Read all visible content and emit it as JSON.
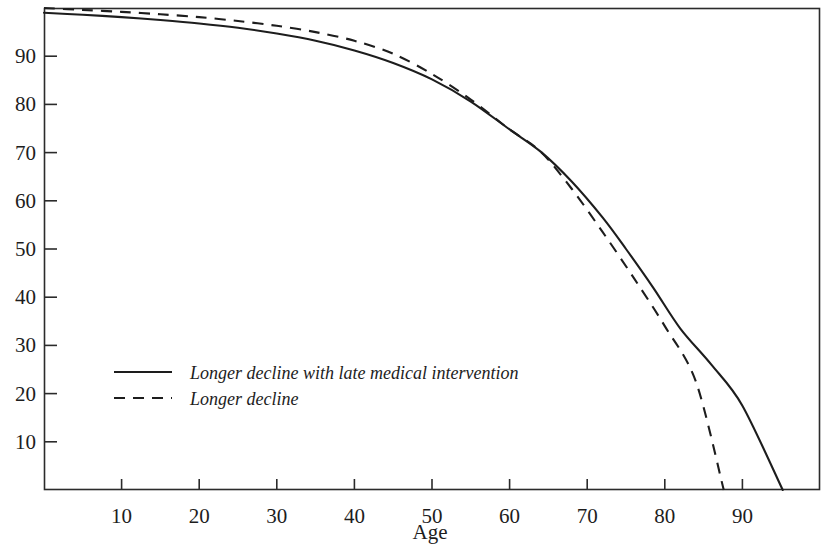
{
  "chart_data": {
    "type": "line",
    "title": "",
    "xlabel": "Age",
    "ylabel": "",
    "xlim": [
      0,
      100
    ],
    "ylim": [
      0,
      100
    ],
    "grid": false,
    "legend_position": "inside-lower-left",
    "xticks": [
      10,
      20,
      30,
      40,
      50,
      60,
      70,
      80,
      90
    ],
    "yticks": [
      10,
      20,
      30,
      40,
      50,
      60,
      70,
      80,
      90
    ],
    "xtick_labels": [
      "10",
      "20",
      "30",
      "40",
      "50",
      "60",
      "70",
      "80",
      "90"
    ],
    "ytick_labels": [
      "10",
      "20",
      "30",
      "40",
      "50",
      "60",
      "70",
      "80",
      "90"
    ],
    "series": [
      {
        "name": "Longer decline with late medical intervention",
        "style": "solid",
        "color": "#1d1d1d",
        "x": [
          0,
          5,
          10,
          15,
          20,
          25,
          30,
          35,
          40,
          45,
          50,
          55,
          60,
          64,
          68,
          72,
          75,
          78.5,
          82,
          86,
          90,
          95.2
        ],
        "y": [
          99.0,
          98.6,
          98.1,
          97.5,
          96.8,
          95.9,
          94.7,
          93.2,
          91.2,
          88.6,
          85.2,
          80.6,
          74.8,
          70.2,
          64.0,
          56.5,
          50.0,
          42.0,
          33.5,
          26.0,
          17.5,
          0.0
        ]
      },
      {
        "name": "Longer decline",
        "style": "dashed",
        "color": "#1d1d1d",
        "x": [
          0,
          5,
          10,
          15,
          20,
          25,
          30,
          35,
          40,
          45,
          50,
          55,
          60,
          64,
          68,
          72,
          76,
          80,
          84,
          87.6
        ],
        "y": [
          100.0,
          99.6,
          99.2,
          98.7,
          98.1,
          97.3,
          96.3,
          95.0,
          93.2,
          90.5,
          86.3,
          81.0,
          74.8,
          70.2,
          62.5,
          53.5,
          44.0,
          34.0,
          22.5,
          0.0
        ]
      }
    ]
  },
  "legend": {
    "entries": [
      {
        "label": "Longer decline with late medical intervention",
        "style": "solid"
      },
      {
        "label": "Longer decline",
        "style": "dashed"
      }
    ]
  },
  "axes": {
    "x_title": "Age"
  }
}
